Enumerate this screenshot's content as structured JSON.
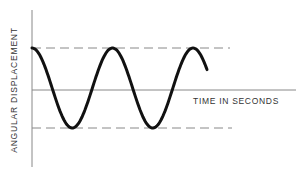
{
  "diagram": {
    "title": "",
    "y_axis_label": "ANGULAR DISPLACEMENT",
    "x_axis_label": "TIME IN SECONDS",
    "elements": {
      "waveform": "sinusoidal oscillation (cosine), approx. 2.3 cycles",
      "upper_bound": "dashed line at maximum amplitude",
      "lower_bound": "dashed line at minimum amplitude",
      "centerline": "horizontal time axis at zero displacement"
    },
    "colors": {
      "line": "#111111",
      "axis": "#888888",
      "dashed": "#888888",
      "background": "#ffffff"
    }
  }
}
